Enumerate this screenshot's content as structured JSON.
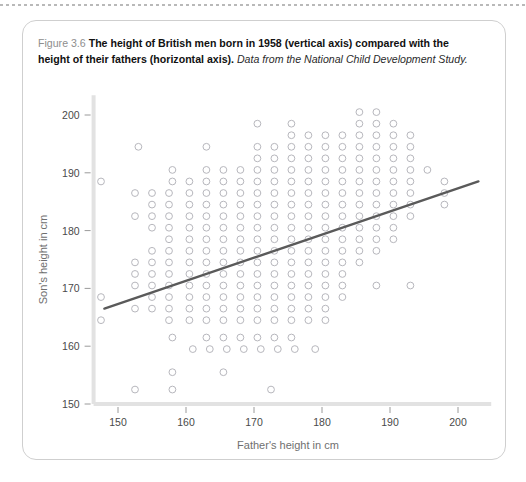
{
  "figure": {
    "label": "Figure 3.6",
    "title": "The height of British men born in 1958 (vertical axis) compared with the height of their fathers (horizontal axis).",
    "source": "Data from the National Child Development Study."
  },
  "colors": {
    "marker": "#b7b7bd",
    "fitline": "#5a5a5a",
    "axis": "#e2e2e2",
    "tick_text": "#4a4a4a",
    "axis_title": "#6f6f6f",
    "box_border": "#cfcfcf"
  },
  "chart_data": {
    "type": "scatter",
    "title": "",
    "xlabel": "Father's height in cm",
    "ylabel": "Son's height in cm",
    "xlim": [
      147,
      204
    ],
    "ylim": [
      150,
      201
    ],
    "xticks": [
      150,
      160,
      170,
      180,
      190,
      200
    ],
    "yticks": [
      150,
      160,
      170,
      180,
      190,
      200
    ],
    "grid": false,
    "legend": "none",
    "marker": "open-circle",
    "x_step": 2.5,
    "y_step": 2,
    "fit_line": {
      "type": "linear",
      "x": [
        148,
        203
      ],
      "y": [
        166.5,
        188.5
      ],
      "slope": 0.4,
      "intercept": 107.3
    },
    "points": [
      [
        185.5,
        200.5
      ],
      [
        188,
        200.5
      ],
      [
        170.5,
        198.5
      ],
      [
        175.5,
        198.5
      ],
      [
        185.5,
        198.5
      ],
      [
        188,
        198.5
      ],
      [
        190.5,
        198.5
      ],
      [
        175.5,
        196.5
      ],
      [
        178,
        196.5
      ],
      [
        180.5,
        196.5
      ],
      [
        183,
        196.5
      ],
      [
        185.5,
        196.5
      ],
      [
        188,
        196.5
      ],
      [
        190.5,
        196.5
      ],
      [
        193,
        196.5
      ],
      [
        153,
        194.5
      ],
      [
        163,
        194.5
      ],
      [
        170.5,
        194.5
      ],
      [
        173,
        194.5
      ],
      [
        175.5,
        194.5
      ],
      [
        178,
        194.5
      ],
      [
        180.5,
        194.5
      ],
      [
        183,
        194.5
      ],
      [
        185.5,
        194.5
      ],
      [
        188,
        194.5
      ],
      [
        190.5,
        194.5
      ],
      [
        193,
        194.5
      ],
      [
        170.5,
        192.5
      ],
      [
        173,
        192.5
      ],
      [
        175.5,
        192.5
      ],
      [
        178,
        192.5
      ],
      [
        180.5,
        192.5
      ],
      [
        183,
        192.5
      ],
      [
        185.5,
        192.5
      ],
      [
        188,
        192.5
      ],
      [
        190.5,
        192.5
      ],
      [
        193,
        192.5
      ],
      [
        158,
        190.5
      ],
      [
        163,
        190.5
      ],
      [
        165.5,
        190.5
      ],
      [
        168,
        190.5
      ],
      [
        170.5,
        190.5
      ],
      [
        173,
        190.5
      ],
      [
        175.5,
        190.5
      ],
      [
        178,
        190.5
      ],
      [
        180.5,
        190.5
      ],
      [
        183,
        190.5
      ],
      [
        185.5,
        190.5
      ],
      [
        188,
        190.5
      ],
      [
        190.5,
        190.5
      ],
      [
        193,
        190.5
      ],
      [
        195.5,
        190.5
      ],
      [
        147.5,
        188.5
      ],
      [
        158,
        188.5
      ],
      [
        160.5,
        188.5
      ],
      [
        163,
        188.5
      ],
      [
        165.5,
        188.5
      ],
      [
        168,
        188.5
      ],
      [
        170.5,
        188.5
      ],
      [
        173,
        188.5
      ],
      [
        175.5,
        188.5
      ],
      [
        178,
        188.5
      ],
      [
        180.5,
        188.5
      ],
      [
        183,
        188.5
      ],
      [
        185.5,
        188.5
      ],
      [
        188,
        188.5
      ],
      [
        190.5,
        188.5
      ],
      [
        193,
        188.5
      ],
      [
        198,
        188.5
      ],
      [
        152.5,
        186.5
      ],
      [
        155,
        186.5
      ],
      [
        157.5,
        186.5
      ],
      [
        160.5,
        186.5
      ],
      [
        163,
        186.5
      ],
      [
        165.5,
        186.5
      ],
      [
        168,
        186.5
      ],
      [
        170.5,
        186.5
      ],
      [
        173,
        186.5
      ],
      [
        175.5,
        186.5
      ],
      [
        178,
        186.5
      ],
      [
        180.5,
        186.5
      ],
      [
        183,
        186.5
      ],
      [
        185.5,
        186.5
      ],
      [
        188,
        186.5
      ],
      [
        190.5,
        186.5
      ],
      [
        193,
        186.5
      ],
      [
        198,
        186.5
      ],
      [
        155,
        184.5
      ],
      [
        157.5,
        184.5
      ],
      [
        160.5,
        184.5
      ],
      [
        163,
        184.5
      ],
      [
        165.5,
        184.5
      ],
      [
        168,
        184.5
      ],
      [
        170.5,
        184.5
      ],
      [
        173,
        184.5
      ],
      [
        175.5,
        184.5
      ],
      [
        178,
        184.5
      ],
      [
        180.5,
        184.5
      ],
      [
        183,
        184.5
      ],
      [
        185.5,
        184.5
      ],
      [
        188,
        184.5
      ],
      [
        190.5,
        184.5
      ],
      [
        193,
        184.5
      ],
      [
        198,
        184.5
      ],
      [
        152.5,
        182.5
      ],
      [
        155,
        182.5
      ],
      [
        157.5,
        182.5
      ],
      [
        160.5,
        182.5
      ],
      [
        163,
        182.5
      ],
      [
        165.5,
        182.5
      ],
      [
        168,
        182.5
      ],
      [
        170.5,
        182.5
      ],
      [
        173,
        182.5
      ],
      [
        175.5,
        182.5
      ],
      [
        178,
        182.5
      ],
      [
        180.5,
        182.5
      ],
      [
        183,
        182.5
      ],
      [
        185.5,
        182.5
      ],
      [
        188,
        182.5
      ],
      [
        190.5,
        182.5
      ],
      [
        193,
        182.5
      ],
      [
        155,
        180.5
      ],
      [
        157.5,
        180.5
      ],
      [
        160.5,
        180.5
      ],
      [
        163,
        180.5
      ],
      [
        165.5,
        180.5
      ],
      [
        168,
        180.5
      ],
      [
        170.5,
        180.5
      ],
      [
        173,
        180.5
      ],
      [
        175.5,
        180.5
      ],
      [
        178,
        180.5
      ],
      [
        180.5,
        180.5
      ],
      [
        183,
        180.5
      ],
      [
        185.5,
        180.5
      ],
      [
        188,
        180.5
      ],
      [
        190.5,
        180.5
      ],
      [
        157.5,
        178.5
      ],
      [
        160.5,
        178.5
      ],
      [
        163,
        178.5
      ],
      [
        165.5,
        178.5
      ],
      [
        168,
        178.5
      ],
      [
        170.5,
        178.5
      ],
      [
        173,
        178.5
      ],
      [
        175.5,
        178.5
      ],
      [
        178,
        178.5
      ],
      [
        180.5,
        178.5
      ],
      [
        183,
        178.5
      ],
      [
        185.5,
        178.5
      ],
      [
        188,
        178.5
      ],
      [
        190.5,
        178.5
      ],
      [
        155,
        176.5
      ],
      [
        157.5,
        176.5
      ],
      [
        160.5,
        176.5
      ],
      [
        163,
        176.5
      ],
      [
        165.5,
        176.5
      ],
      [
        168,
        176.5
      ],
      [
        170.5,
        176.5
      ],
      [
        173,
        176.5
      ],
      [
        175.5,
        176.5
      ],
      [
        178,
        176.5
      ],
      [
        180.5,
        176.5
      ],
      [
        183,
        176.5
      ],
      [
        185.5,
        176.5
      ],
      [
        188,
        176.5
      ],
      [
        152.5,
        174.5
      ],
      [
        155,
        174.5
      ],
      [
        157.5,
        174.5
      ],
      [
        160.5,
        174.5
      ],
      [
        163,
        174.5
      ],
      [
        165.5,
        174.5
      ],
      [
        168,
        174.5
      ],
      [
        170.5,
        174.5
      ],
      [
        173,
        174.5
      ],
      [
        175.5,
        174.5
      ],
      [
        178,
        174.5
      ],
      [
        180.5,
        174.5
      ],
      [
        183,
        174.5
      ],
      [
        185.5,
        174.5
      ],
      [
        152.5,
        172.5
      ],
      [
        155,
        172.5
      ],
      [
        157.5,
        172.5
      ],
      [
        160.5,
        172.5
      ],
      [
        163,
        172.5
      ],
      [
        165.5,
        172.5
      ],
      [
        168,
        172.5
      ],
      [
        170.5,
        172.5
      ],
      [
        173,
        172.5
      ],
      [
        175.5,
        172.5
      ],
      [
        178,
        172.5
      ],
      [
        180.5,
        172.5
      ],
      [
        183,
        172.5
      ],
      [
        152.5,
        170.5
      ],
      [
        155,
        170.5
      ],
      [
        157.5,
        170.5
      ],
      [
        160.5,
        170.5
      ],
      [
        163,
        170.5
      ],
      [
        165.5,
        170.5
      ],
      [
        168,
        170.5
      ],
      [
        170.5,
        170.5
      ],
      [
        173,
        170.5
      ],
      [
        175.5,
        170.5
      ],
      [
        178,
        170.5
      ],
      [
        180.5,
        170.5
      ],
      [
        183,
        170.5
      ],
      [
        188,
        170.5
      ],
      [
        193,
        170.5
      ],
      [
        147.5,
        168.5
      ],
      [
        155,
        168.5
      ],
      [
        157.5,
        168.5
      ],
      [
        160.5,
        168.5
      ],
      [
        163,
        168.5
      ],
      [
        165.5,
        168.5
      ],
      [
        168,
        168.5
      ],
      [
        170.5,
        168.5
      ],
      [
        173,
        168.5
      ],
      [
        175.5,
        168.5
      ],
      [
        178,
        168.5
      ],
      [
        180.5,
        168.5
      ],
      [
        183,
        168.5
      ],
      [
        152.5,
        166.5
      ],
      [
        155,
        166.5
      ],
      [
        157.5,
        166.5
      ],
      [
        160.5,
        166.5
      ],
      [
        163,
        166.5
      ],
      [
        165.5,
        166.5
      ],
      [
        168,
        166.5
      ],
      [
        170.5,
        166.5
      ],
      [
        173,
        166.5
      ],
      [
        175.5,
        166.5
      ],
      [
        178,
        166.5
      ],
      [
        180.5,
        166.5
      ],
      [
        147.5,
        164.5
      ],
      [
        157.5,
        164.5
      ],
      [
        160.5,
        164.5
      ],
      [
        163,
        164.5
      ],
      [
        165.5,
        164.5
      ],
      [
        168,
        164.5
      ],
      [
        170.5,
        164.5
      ],
      [
        173,
        164.5
      ],
      [
        175.5,
        164.5
      ],
      [
        178,
        164.5
      ],
      [
        180.5,
        164.5
      ],
      [
        158,
        161.5
      ],
      [
        163,
        161.5
      ],
      [
        165.5,
        161.5
      ],
      [
        168,
        161.5
      ],
      [
        170.5,
        161.5
      ],
      [
        173,
        161.5
      ],
      [
        175.5,
        161.5
      ],
      [
        161,
        159.5
      ],
      [
        163.5,
        159.5
      ],
      [
        166,
        159.5
      ],
      [
        168.5,
        159.5
      ],
      [
        171,
        159.5
      ],
      [
        173.5,
        159.5
      ],
      [
        176,
        159.5
      ],
      [
        179,
        159.5
      ],
      [
        158,
        155.5
      ],
      [
        165.5,
        155.5
      ],
      [
        152.5,
        152.5
      ],
      [
        158,
        152.5
      ],
      [
        172.5,
        152.5
      ]
    ]
  }
}
